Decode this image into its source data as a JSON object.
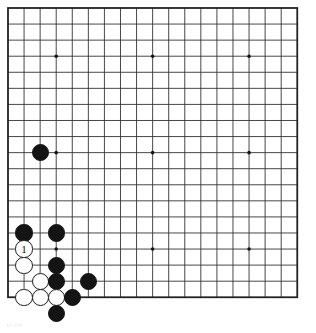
{
  "diagram": {
    "kind": "go-board-diagram",
    "caption": "ti-tit",
    "board": {
      "size": 19,
      "origin_x": 8,
      "origin_y": 8,
      "spacing": 16.07,
      "line_color": "#333333",
      "border_color": "#222222",
      "background_color": "#ffffff",
      "border_width": 1.8,
      "line_width": 0.9,
      "star_points": [
        {
          "col": 4,
          "row": 4
        },
        {
          "col": 10,
          "row": 4
        },
        {
          "col": 16,
          "row": 4
        },
        {
          "col": 4,
          "row": 10
        },
        {
          "col": 10,
          "row": 10
        },
        {
          "col": 16,
          "row": 10
        },
        {
          "col": 4,
          "row": 16
        },
        {
          "col": 10,
          "row": 16
        },
        {
          "col": 16,
          "row": 16
        }
      ],
      "star_point_radius": 1.8,
      "star_point_color": "#141414"
    },
    "stone_radius": 8.6,
    "colors": {
      "black": "#141414",
      "white": "#ffffff",
      "white_outline": "#1a1a1a",
      "black_label": "#ffffff",
      "white_label": "#111111"
    },
    "stones": [
      {
        "id": "b-c3-r10",
        "color": "black",
        "col": 3,
        "row": 10,
        "label": ""
      },
      {
        "id": "b-c2-r15",
        "color": "black",
        "col": 2,
        "row": 15,
        "label": ""
      },
      {
        "id": "b-c4-r15",
        "color": "black",
        "col": 4,
        "row": 15,
        "label": ""
      },
      {
        "id": "w-c2-r16",
        "color": "white",
        "col": 2,
        "row": 16,
        "label": "1"
      },
      {
        "id": "w-c2-r17",
        "color": "white",
        "col": 2,
        "row": 17,
        "label": ""
      },
      {
        "id": "b-c4-r17",
        "color": "black",
        "col": 4,
        "row": 17,
        "label": ""
      },
      {
        "id": "w-c3-r18",
        "color": "white",
        "col": 3,
        "row": 18,
        "label": ""
      },
      {
        "id": "b-c4-r18",
        "color": "black",
        "col": 4,
        "row": 18,
        "label": ""
      },
      {
        "id": "b-c6-r18",
        "color": "black",
        "col": 6,
        "row": 18,
        "label": ""
      },
      {
        "id": "w-c2-r19",
        "color": "white",
        "col": 2,
        "row": 19,
        "label": ""
      },
      {
        "id": "w-c3-r19",
        "color": "white",
        "col": 3,
        "row": 19,
        "label": ""
      },
      {
        "id": "w-c4-r19",
        "color": "white",
        "col": 4,
        "row": 19,
        "label": ""
      },
      {
        "id": "b-c5-r19",
        "color": "black",
        "col": 5,
        "row": 19,
        "label": ""
      },
      {
        "id": "b-c4-r20",
        "color": "black",
        "col": 4,
        "row": 20,
        "label": ""
      }
    ],
    "move_markers": [
      {
        "number": "1",
        "color": "white",
        "col": 2,
        "row": 16
      }
    ]
  }
}
